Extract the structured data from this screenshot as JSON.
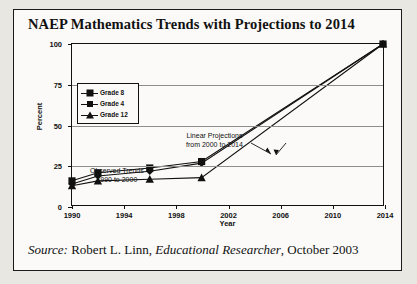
{
  "figure": {
    "title": "NAEP Mathematics Trends with Projections to 2014",
    "source_prefix": "Source:",
    "source_author": " Robert L. Linn, ",
    "source_journal": "Educational Researcher",
    "source_date": ", October 2003"
  },
  "colors": {
    "ink": "#111111",
    "grid": "#8e8e8e",
    "paper": "#fbfaf8",
    "scan_background": "#e9e7e2"
  },
  "chart_data": {
    "type": "line",
    "title": "NAEP Mathematics Trends with Projections to 2014",
    "xlabel": "Year",
    "ylabel": "Percent",
    "xlim": [
      1990,
      2014
    ],
    "ylim": [
      0,
      100
    ],
    "xticks": [
      1990,
      1994,
      1998,
      2002,
      2006,
      2010,
      2014
    ],
    "yticks": [
      0,
      25,
      50,
      75,
      100
    ],
    "grid": true,
    "legend_position": "upper-left",
    "x": [
      1990,
      1992,
      1996,
      2000,
      2014
    ],
    "series": [
      {
        "name": "Grade 8",
        "marker": "square",
        "values": [
          15,
          20,
          23,
          27,
          100
        ]
      },
      {
        "name": "Grade 4",
        "marker": "diamond",
        "values": [
          13,
          18,
          21,
          26,
          100
        ]
      },
      {
        "name": "Grade 12",
        "marker": "triangle",
        "values": [
          12,
          15,
          16,
          17,
          100
        ]
      }
    ],
    "annotations": [
      {
        "id": "observed",
        "line1": "Observed Trends",
        "line2": "1990 to 2000"
      },
      {
        "id": "projections",
        "line1": "Linear Projections",
        "line2": "from 2000 to 2014"
      }
    ]
  }
}
